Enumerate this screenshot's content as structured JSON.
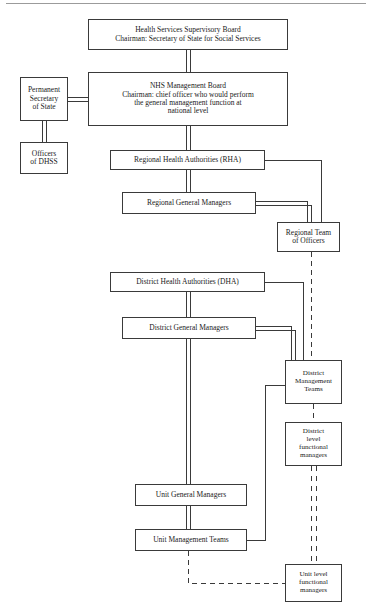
{
  "diagram": {
    "type": "organisational-chart",
    "background_color": "#ffffff",
    "line_color": "#3a3a3a",
    "top_rule_color": "#9b9b9b",
    "nodes": [
      {
        "id": "hssb",
        "label": "Health Services Supervisory Board\nChairman: Secretary of State for Social Services",
        "x": 88,
        "y": 19,
        "w": 200,
        "h": 31,
        "font": "fs-75"
      },
      {
        "id": "permanent-secretary",
        "label": "Permanent\nSecretary\nof State",
        "x": 20,
        "y": 77,
        "w": 48,
        "h": 44,
        "font": "fs-75"
      },
      {
        "id": "nhs-management-board",
        "label": "NHS Management Board\nChairman: chief officer who would perform\nthe general management function at\nnational level",
        "x": 88,
        "y": 72,
        "w": 200,
        "h": 54,
        "font": "fs-75"
      },
      {
        "id": "officers-dhss",
        "label": "Officers\nof DHSS",
        "x": 20,
        "y": 142,
        "w": 48,
        "h": 32,
        "font": "fs-75"
      },
      {
        "id": "rha",
        "label": "Regional Health Authorities (RHA)",
        "x": 110,
        "y": 150,
        "w": 155,
        "h": 20,
        "font": "fs-75"
      },
      {
        "id": "regional-general-managers",
        "label": "Regional General Managers",
        "x": 122,
        "y": 192,
        "w": 134,
        "h": 22,
        "font": "fs-75"
      },
      {
        "id": "regional-team-of-officers",
        "label": "Regional Team\nof Officers",
        "x": 277,
        "y": 222,
        "w": 63,
        "h": 30,
        "font": "fs-75"
      },
      {
        "id": "dha",
        "label": "District Health Authorities (DHA)",
        "x": 110,
        "y": 272,
        "w": 155,
        "h": 20,
        "font": "fs-75"
      },
      {
        "id": "district-general-managers",
        "label": "District General Managers",
        "x": 122,
        "y": 317,
        "w": 134,
        "h": 22,
        "font": "fs-75"
      },
      {
        "id": "district-management-teams",
        "label": "District\nManagement\nTeams",
        "x": 285,
        "y": 360,
        "w": 57,
        "h": 44,
        "font": "fs-7"
      },
      {
        "id": "district-level-functional-managers",
        "label": "District\nlevel\nfunctional\nmanagers",
        "x": 285,
        "y": 422,
        "w": 57,
        "h": 44,
        "font": "fs-7"
      },
      {
        "id": "unit-general-managers",
        "label": "Unit General Managers",
        "x": 135,
        "y": 484,
        "w": 112,
        "h": 22,
        "font": "fs-75"
      },
      {
        "id": "unit-management-teams",
        "label": "Unit Management Teams",
        "x": 135,
        "y": 529,
        "w": 112,
        "h": 22,
        "font": "fs-75"
      },
      {
        "id": "unit-level-functional-managers",
        "label": "Unit level\nfunctional\nmanagers",
        "x": 285,
        "y": 564,
        "w": 57,
        "h": 38,
        "font": "fs-7"
      }
    ],
    "connectors": [
      {
        "id": "hssb-to-nhs-board",
        "style": "double-solid",
        "from": "hssb",
        "to": "nhs-management-board"
      },
      {
        "id": "permanent-secretary-to-nhs-board",
        "style": "double-solid",
        "from": "permanent-secretary",
        "to": "nhs-management-board"
      },
      {
        "id": "permanent-secretary-to-officers-dhss",
        "style": "double-solid",
        "from": "permanent-secretary",
        "to": "officers-dhss"
      },
      {
        "id": "nhs-board-to-rha",
        "style": "double-solid",
        "from": "nhs-management-board",
        "to": "rha"
      },
      {
        "id": "rha-to-regional-general-managers",
        "style": "double-solid",
        "from": "rha",
        "to": "regional-general-managers"
      },
      {
        "id": "rha-to-regional-team-of-officers",
        "style": "single-solid",
        "from": "rha",
        "to": "regional-team-of-officers"
      },
      {
        "id": "regional-general-managers-to-regional-team",
        "style": "double-solid",
        "from": "regional-general-managers",
        "to": "regional-team-of-officers"
      },
      {
        "id": "regional-team-to-district-management-teams",
        "style": "dashed",
        "from": "regional-team-of-officers",
        "to": "district-management-teams"
      },
      {
        "id": "dha-to-district-general-managers",
        "style": "double-solid",
        "from": "dha",
        "to": "district-general-managers"
      },
      {
        "id": "dha-to-district-management-teams",
        "style": "single-solid",
        "from": "dha",
        "to": "district-management-teams"
      },
      {
        "id": "district-general-managers-to-district-management-teams",
        "style": "double-solid",
        "from": "district-general-managers",
        "to": "district-management-teams"
      },
      {
        "id": "district-general-managers-to-unit-general-managers",
        "style": "double-solid",
        "from": "district-general-managers",
        "to": "unit-general-managers"
      },
      {
        "id": "district-management-teams-to-unit-management-teams",
        "style": "single-solid",
        "from": "district-management-teams",
        "to": "unit-management-teams"
      },
      {
        "id": "district-management-teams-to-district-functional",
        "style": "dashed",
        "from": "district-management-teams",
        "to": "district-level-functional-managers"
      },
      {
        "id": "district-functional-to-unit-functional",
        "style": "double-dashed",
        "from": "district-level-functional-managers",
        "to": "unit-level-functional-managers"
      },
      {
        "id": "unit-general-managers-to-unit-management-teams",
        "style": "double-solid",
        "from": "unit-general-managers",
        "to": "unit-management-teams"
      },
      {
        "id": "unit-management-teams-to-unit-functional",
        "style": "dashed",
        "from": "unit-management-teams",
        "to": "unit-level-functional-managers"
      }
    ]
  }
}
